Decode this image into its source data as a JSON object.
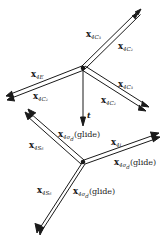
{
  "diagram": {
    "type": "vector-diagram",
    "nodes": [
      {
        "id": "upper-node",
        "x": 83,
        "y": 68
      },
      {
        "id": "lower-node",
        "x": 83,
        "y": 162
      }
    ],
    "translation_vector": {
      "label": "t",
      "from": "upper-node",
      "to_y": 125
    },
    "upper_arms": [
      {
        "id": "arm-upper-right",
        "end": [
          139,
          13
        ],
        "labels": [
          "x",
          "4C",
          "3"
        ],
        "labels2": [
          "x",
          "4C",
          "2"
        ]
      },
      {
        "id": "arm-upper-left",
        "end": [
          8,
          97
        ],
        "labels": [
          "x",
          "4E",
          ""
        ],
        "labels2": [
          "x",
          "4C",
          "2"
        ]
      },
      {
        "id": "arm-upper-lower-right",
        "end": [
          148,
          111
        ],
        "labels": [
          "x",
          "4C",
          "3"
        ],
        "labels2": [
          "x",
          "4C",
          "2"
        ]
      }
    ],
    "lower_arms": [
      {
        "id": "arm-lower-upper-left",
        "end": [
          28,
          112
        ]
      },
      {
        "id": "arm-lower-right",
        "end": [
          157,
          136
        ]
      },
      {
        "id": "arm-lower-lower-left",
        "end": [
          38,
          231
        ]
      }
    ]
  },
  "labels": {
    "ur_a": {
      "main": "x",
      "sub": "4C",
      "subsub": "3"
    },
    "ur_b": {
      "main": "x",
      "sub": "4C",
      "subsub": "2"
    },
    "ul_a": {
      "main": "x",
      "sub": "4E"
    },
    "ul_b": {
      "main": "x",
      "sub": "4C",
      "subsub": "2"
    },
    "lr_a": {
      "main": "x",
      "sub": "4C",
      "subsub": "3"
    },
    "lr_b": {
      "main": "x",
      "sub": "4C",
      "subsub": "2"
    },
    "t": "t",
    "low_ul_a": {
      "main": "x",
      "sub": "4S",
      "subsub": "6"
    },
    "low_glide_top": {
      "main": "x",
      "sub": "4σ",
      "subsub": "d",
      "suffix": "(glide)"
    },
    "low_r_a": {
      "main": "x",
      "sub": "4i"
    },
    "low_r_b": {
      "main": "x",
      "sub": "4σ",
      "subsub": "d",
      "suffix": "(glide)"
    },
    "low_ll_a": {
      "main": "x",
      "sub": "4S",
      "subsub": "6"
    },
    "low_ll_b": {
      "main": "x",
      "sub": "4σ",
      "subsub": "d",
      "suffix": "(glide)"
    }
  },
  "text": {
    "ur_a": "4C₃",
    "ur_b": "4C₂",
    "ul_a": "4E",
    "ul_b": "4C₂",
    "lr_a": "4C₃",
    "lr_b": "4C₂",
    "t": "t",
    "x": "x",
    "low_ul_a": "4S₆",
    "low_glide_top": "4σ",
    "low_glide_top_d": "d",
    "glide": "(glide)",
    "low_r_a": "4i",
    "low_r_b": "4σ",
    "low_ll_a": "4S₆",
    "low_ll_b": "4σ",
    "d": "d"
  },
  "colors": {
    "ink": "#1a1a1a",
    "background": "#ffffff"
  }
}
